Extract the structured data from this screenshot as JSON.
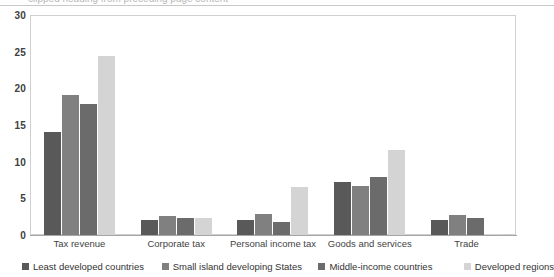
{
  "chart_data": {
    "type": "bar",
    "title": "",
    "subtitle": "",
    "xlabel": "",
    "ylabel": "",
    "ylim": [
      0,
      30
    ],
    "yticks": [
      0,
      5,
      10,
      15,
      20,
      25,
      30
    ],
    "grid": false,
    "legend_position": "bottom",
    "categories": [
      "Tax revenue",
      "Corporate tax",
      "Personal income tax",
      "Goods and services",
      "Trade"
    ],
    "series": [
      {
        "name": "Least developed countries",
        "color": "#595959",
        "values": [
          14.0,
          2.1,
          2.0,
          7.2,
          2.0
        ]
      },
      {
        "name": "Small island developing States",
        "color": "#808080",
        "values": [
          19.1,
          2.6,
          2.9,
          6.7,
          2.7
        ]
      },
      {
        "name": "Middle-income countries",
        "color": "#6b6b6b",
        "values": [
          17.8,
          2.3,
          1.8,
          7.9,
          2.3
        ]
      },
      {
        "name": "Developed regions",
        "color": "#d4d4d4",
        "values": [
          24.4,
          2.3,
          6.5,
          11.6,
          0.2
        ]
      }
    ]
  },
  "axis": {
    "y_tick_labels": [
      "30",
      "25",
      "20",
      "15",
      "10",
      "5",
      "0"
    ]
  },
  "top_bleed": {
    "text": "clipped heading from preceding page content"
  }
}
